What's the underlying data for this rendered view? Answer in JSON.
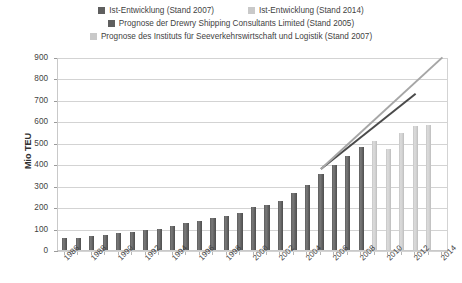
{
  "legend": {
    "rows": [
      [
        {
          "label": "Ist-Entwicklung (Stand 2007)",
          "color": "#5f5f5f",
          "marker": "square-swatch"
        },
        {
          "label": "Ist-Entwicklung (Stand 2014)",
          "color": "#c9c9c9",
          "marker": "square-swatch"
        }
      ],
      [
        {
          "label": "Prognose der Drewry Shipping Consultants Limited (Stand 2005)",
          "color": "#5f5f5f",
          "marker": "square-swatch"
        }
      ],
      [
        {
          "label": "Prognose des Instituts für Seeverkehrswirtschaft und Logistik (Stand 2007)",
          "color": "#c9c9c9",
          "marker": "square-swatch"
        }
      ]
    ]
  },
  "axes": {
    "ylabel": "Mio TEU",
    "yticks": [
      "900",
      "800",
      "700",
      "600",
      "500",
      "400",
      "300",
      "200",
      "100",
      "0"
    ],
    "ylim": [
      0,
      900
    ],
    "xticks": [
      "1986",
      "1988",
      "1990",
      "1992",
      "1994",
      "1996",
      "1998",
      "2000",
      "2002",
      "2004",
      "2006",
      "2008",
      "2010",
      "2012",
      "2014"
    ],
    "grid": true
  },
  "chart_data": {
    "type": "bar",
    "title": "",
    "xlabel": "",
    "ylabel": "Mio TEU",
    "ylim": [
      0,
      900
    ],
    "grid": true,
    "legend_position": "top",
    "categories": [
      "1986",
      "1987",
      "1988",
      "1989",
      "1990",
      "1991",
      "1992",
      "1993",
      "1994",
      "1995",
      "1996",
      "1997",
      "1998",
      "1999",
      "2000",
      "2001",
      "2002",
      "2003",
      "2004",
      "2005",
      "2006",
      "2007",
      "2008",
      "2009",
      "2010",
      "2011",
      "2012",
      "2013",
      "2014"
    ],
    "series": [
      {
        "name": "Ist-Entwicklung (Stand 2007)",
        "type": "bar",
        "color": "#5f5f5f",
        "values": [
          55,
          58,
          65,
          72,
          80,
          85,
          92,
          100,
          112,
          125,
          135,
          148,
          160,
          172,
          200,
          210,
          230,
          265,
          305,
          355,
          395,
          440,
          480,
          null,
          null,
          null,
          null,
          null,
          null
        ]
      },
      {
        "name": "Ist-Entwicklung (Stand 2014)",
        "type": "bar",
        "color": "#c9c9c9",
        "values": [
          null,
          null,
          null,
          null,
          null,
          null,
          null,
          null,
          null,
          null,
          null,
          null,
          null,
          null,
          null,
          null,
          null,
          null,
          null,
          null,
          null,
          null,
          null,
          510,
          470,
          545,
          580,
          585,
          null
        ]
      },
      {
        "name": "Prognose der Drewry Shipping Consultants Limited (Stand 2005)",
        "type": "line",
        "color": "#4a4a4a",
        "x": [
          "2005",
          "2012"
        ],
        "values": [
          380,
          730
        ]
      },
      {
        "name": "Prognose des Instituts für Seeverkehrswirtschaft und Logistik (Stand 2007)",
        "type": "line",
        "color": "#a6a6a6",
        "x": [
          "2005",
          "2014"
        ],
        "values": [
          380,
          900
        ]
      }
    ]
  }
}
